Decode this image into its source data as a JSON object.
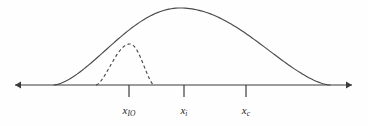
{
  "figure": {
    "background_color": "#fefefe",
    "stroke_color": "#4a4a4a",
    "axis_color": "#3b3b3b",
    "label_color": "#262626",
    "width": 368,
    "height": 126
  },
  "axis": {
    "name": "horizontal-axis",
    "baseline_y": 85,
    "x_start": 15,
    "x_end": 352,
    "arrow_left": true,
    "arrow_right": true
  },
  "ticks": [
    {
      "id": "tick-x-io",
      "x": 129,
      "base": "x",
      "subscript": "IO",
      "label": "x_IO"
    },
    {
      "id": "tick-x-i",
      "x": 184,
      "base": "x",
      "subscript": "i",
      "label": "x_i"
    },
    {
      "id": "tick-x-c",
      "x": 246,
      "base": "x",
      "subscript": "c",
      "label": "x_c"
    }
  ],
  "curves": [
    {
      "id": "curve-outer-solid",
      "style": "solid",
      "x_left": 54,
      "x_right": 330,
      "peak_x": 180,
      "peak_y": 8,
      "description": "Large solid bell-shaped curve spanning the full axis"
    },
    {
      "id": "curve-inner-dashed",
      "style": "dashed",
      "x_left": 96,
      "x_right": 154,
      "peak_x": 130,
      "peak_y": 44,
      "description": "Small dashed bell-shaped curve centered near x_IO"
    }
  ],
  "chart_data": {
    "type": "line",
    "title": "",
    "xlabel": "",
    "ylabel": "",
    "grid": false,
    "legend": "none",
    "axis": {
      "baseline_y": 85,
      "x_range": [
        15,
        352
      ],
      "arrows": "both"
    },
    "tick_labels": [
      "x_IO",
      "x_i",
      "x_c"
    ],
    "tick_positions": [
      129,
      184,
      246
    ],
    "series": [
      {
        "name": "solid-distribution",
        "style": "solid",
        "support": [
          54,
          330
        ],
        "peak": [
          180,
          8
        ],
        "amplitude_px": 77
      },
      {
        "name": "dashed-distribution",
        "style": "dashed",
        "support": [
          96,
          154
        ],
        "peak": [
          130,
          44
        ],
        "amplitude_px": 41
      }
    ]
  }
}
